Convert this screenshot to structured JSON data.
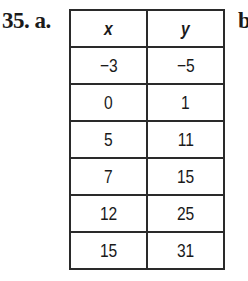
{
  "problem": {
    "number_label": "35. a.",
    "next_part_label": "b"
  },
  "table": {
    "headers": [
      "x",
      "y"
    ],
    "rows": [
      [
        "−3",
        "−5"
      ],
      [
        "0",
        "1"
      ],
      [
        "5",
        "11"
      ],
      [
        "7",
        "15"
      ],
      [
        "12",
        "25"
      ],
      [
        "15",
        "31"
      ]
    ]
  }
}
